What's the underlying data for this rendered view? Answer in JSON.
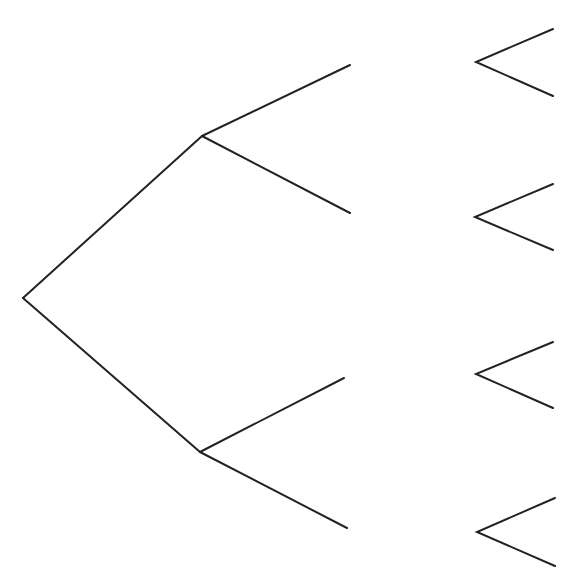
{
  "diagram": {
    "type": "tree-diagram",
    "stroke_color": "#222222",
    "background": "#ffffff",
    "stroke_width": 2,
    "root": {
      "x": 23,
      "y": 298
    },
    "level1_nodes": [
      {
        "id": "upper",
        "x": 202,
        "y": 136
      },
      {
        "id": "lower",
        "x": 200,
        "y": 452
      }
    ],
    "level2_endpoints": [
      {
        "parent": "upper",
        "x": 350,
        "y": 65
      },
      {
        "parent": "upper",
        "x": 350,
        "y": 213
      },
      {
        "parent": "lower",
        "x": 344,
        "y": 378
      },
      {
        "parent": "lower",
        "x": 347,
        "y": 528
      }
    ],
    "level3_forks": [
      {
        "vertex": {
          "x": 476,
          "y": 62
        },
        "top": {
          "x": 553,
          "y": 29
        },
        "bottom": {
          "x": 553,
          "y": 96
        }
      },
      {
        "vertex": {
          "x": 475,
          "y": 217
        },
        "top": {
          "x": 553,
          "y": 184
        },
        "bottom": {
          "x": 553,
          "y": 250
        }
      },
      {
        "vertex": {
          "x": 476,
          "y": 374
        },
        "top": {
          "x": 553,
          "y": 342
        },
        "bottom": {
          "x": 553,
          "y": 408
        }
      },
      {
        "vertex": {
          "x": 477,
          "y": 532
        },
        "top": {
          "x": 555,
          "y": 498
        },
        "bottom": {
          "x": 555,
          "y": 566
        }
      }
    ],
    "labels": []
  }
}
